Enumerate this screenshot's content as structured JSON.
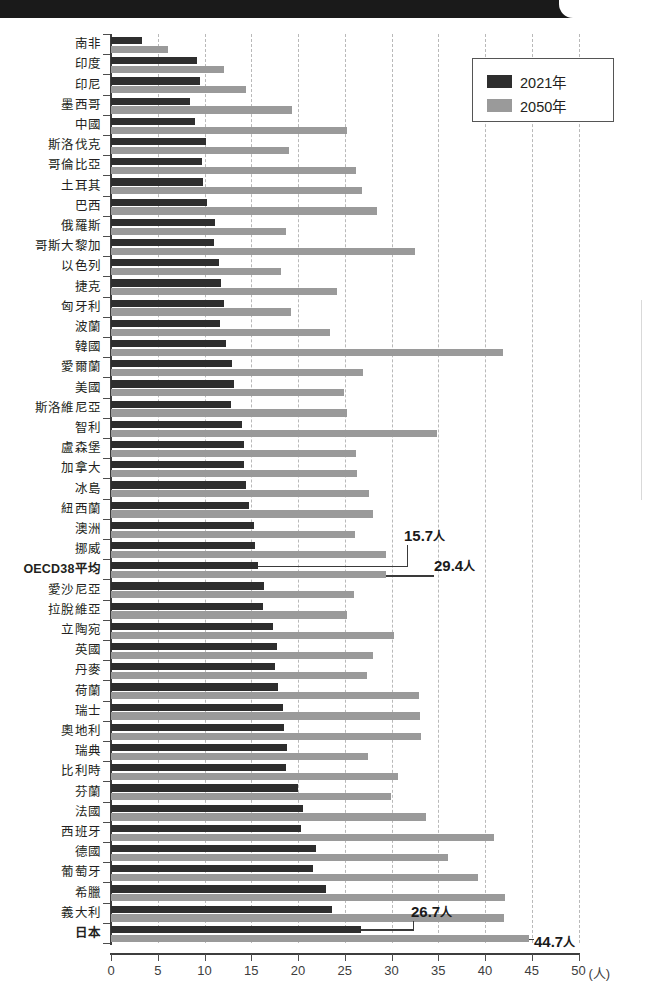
{
  "chart_data": {
    "type": "bar",
    "orientation": "horizontal",
    "title": "",
    "xlabel": "(人)",
    "ylabel": "",
    "xlim": [
      0,
      50
    ],
    "xticks": [
      0,
      5,
      10,
      15,
      20,
      25,
      30,
      35,
      40,
      45,
      50
    ],
    "xtick_labels": [
      "0",
      "5",
      "10",
      "15",
      "20",
      "25",
      "30",
      "35",
      "40",
      "45",
      "50"
    ],
    "grid": true,
    "grid_axis": "x",
    "grid_style": "dashed",
    "legend_position": "top-right",
    "categories": [
      "南非",
      "印度",
      "印尼",
      "墨西哥",
      "中國",
      "斯洛伐克",
      "哥倫比亞",
      "土耳其",
      "巴西",
      "俄羅斯",
      "哥斯大黎加",
      "以色列",
      "捷克",
      "匈牙利",
      "波蘭",
      "韓國",
      "愛爾蘭",
      "美國",
      "斯洛維尼亞",
      "智利",
      "盧森堡",
      "加拿大",
      "冰島",
      "紐西蘭",
      "澳洲",
      "挪威",
      "OECD38平均",
      "愛沙尼亞",
      "拉脫維亞",
      "立陶宛",
      "英國",
      "丹麥",
      "荷蘭",
      "瑞士",
      "奧地利",
      "瑞典",
      "比利時",
      "芬蘭",
      "法國",
      "西班牙",
      "德國",
      "葡萄牙",
      "希臘",
      "義大利",
      "日本"
    ],
    "series": [
      {
        "name": "2021年",
        "color": "#2e2e2e",
        "values": [
          3.3,
          9.2,
          9.5,
          8.4,
          9.0,
          10.2,
          9.7,
          9.8,
          10.3,
          11.1,
          11.0,
          11.6,
          11.8,
          12.1,
          11.7,
          12.3,
          12.9,
          13.2,
          12.8,
          14.0,
          14.2,
          14.2,
          14.4,
          14.8,
          15.3,
          15.4,
          15.7,
          16.4,
          16.3,
          17.3,
          17.8,
          17.5,
          17.9,
          18.4,
          18.5,
          18.8,
          18.7,
          20.0,
          20.5,
          20.3,
          21.9,
          21.6,
          23.0,
          23.6,
          26.7
        ]
      },
      {
        "name": "2050年",
        "color": "#9a9a9a",
        "values": [
          6.1,
          12.1,
          14.4,
          19.4,
          25.2,
          19.0,
          26.2,
          26.8,
          28.4,
          18.7,
          32.5,
          18.2,
          24.2,
          19.2,
          23.4,
          41.9,
          27.0,
          24.9,
          25.2,
          34.9,
          26.2,
          26.3,
          27.6,
          28.0,
          26.1,
          29.4,
          29.4,
          26.0,
          25.2,
          30.3,
          28.0,
          27.4,
          32.9,
          33.0,
          33.2,
          27.5,
          30.7,
          29.9,
          33.7,
          41.0,
          36.0,
          39.2,
          42.1,
          42.0,
          44.7
        ]
      }
    ],
    "annotations": [
      {
        "label": "15.7",
        "unit": "人",
        "category": "OECD38平均",
        "series": "2021年",
        "value": 15.7
      },
      {
        "label": "29.4",
        "unit": "人",
        "category": "OECD38平均",
        "series": "2050年",
        "value": 29.4
      },
      {
        "label": "26.7",
        "unit": "人",
        "category": "日本",
        "series": "2021年",
        "value": 26.7
      },
      {
        "label": "44.7",
        "unit": "人",
        "category": "日本",
        "series": "2050年",
        "value": 44.7
      }
    ],
    "bold_categories": [
      "OECD38平均",
      "日本"
    ]
  },
  "legend": {
    "items": [
      {
        "label": "2021年",
        "color": "#2e2e2e"
      },
      {
        "label": "2050年",
        "color": "#9a9a9a"
      }
    ]
  },
  "axis_unit_label": "(人)",
  "colors": {
    "series_2021": "#2e2e2e",
    "series_2050": "#9a9a9a",
    "grid": "#b9b9b9",
    "axis": "#3d3d3d",
    "text": "#231f20",
    "topbar": "#1a1a1a"
  }
}
